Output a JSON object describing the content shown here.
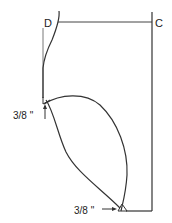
{
  "diagram": {
    "type": "sewing-pattern",
    "points": {
      "d_label": "D",
      "c_label": "C"
    },
    "measurements": {
      "upper_left": "3/8 \"",
      "bottom": "3/8 \""
    },
    "stroke_color": "#333333",
    "background": "#ffffff"
  }
}
